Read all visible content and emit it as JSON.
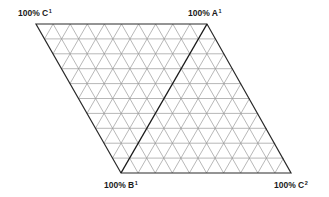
{
  "diagram": {
    "type": "triangular-grid-rhombus",
    "divisions": 10,
    "vertices": {
      "top_left": [
        36,
        24
      ],
      "top_right": [
        207,
        24
      ],
      "bottom_right": [
        291,
        173
      ],
      "bottom_left": [
        121,
        173
      ]
    },
    "colors": {
      "outline": "#2a2a2a",
      "grid": "#9a9a9a",
      "divider": "#1a1a1a",
      "label": "#1a1a1a"
    },
    "divider": {
      "from": "top_right",
      "to": "bottom_left"
    },
    "labels": [
      {
        "id": "c1",
        "prefix": "100% C",
        "sup": "1",
        "x": 18,
        "y": 9
      },
      {
        "id": "a1",
        "prefix": "100% A",
        "sup": "1",
        "x": 188,
        "y": 9
      },
      {
        "id": "b1",
        "prefix": "100% B",
        "sup": "1",
        "x": 104,
        "y": 181
      },
      {
        "id": "c2",
        "prefix": "100% C",
        "sup": "2",
        "x": 274,
        "y": 181
      }
    ]
  }
}
